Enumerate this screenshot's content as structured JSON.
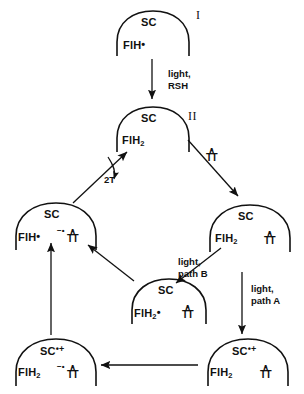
{
  "figure": {
    "type": "reaction-scheme"
  },
  "nodes": [
    {
      "id": "top",
      "roman": "I",
      "sc": "SC",
      "sc_charge": "",
      "flavin": "FlH",
      "flavin_sub": "",
      "flavin_dot": "•",
      "dimer": null
    },
    {
      "id": "second",
      "roman": "II",
      "sc": "SC",
      "sc_charge": "",
      "flavin": "FlH",
      "flavin_sub": "2",
      "flavin_dot": "",
      "dimer": null
    },
    {
      "id": "right",
      "roman": "",
      "sc": "SC",
      "sc_charge": "",
      "flavin": "FlH",
      "flavin_sub": "2",
      "flavin_dot": "",
      "dimer": {
        "caret": "∧",
        "tt": "TT",
        "charge": ""
      }
    },
    {
      "id": "center",
      "roman": "",
      "sc": "SC",
      "sc_charge": "",
      "flavin": "FlH",
      "flavin_sub": "2",
      "flavin_dot": "•",
      "dimer": {
        "caret": "∧",
        "tt": "TT",
        "charge": ""
      }
    },
    {
      "id": "left",
      "roman": "",
      "sc": "SC",
      "sc_charge": "",
      "flavin": "FlH",
      "flavin_sub": "",
      "flavin_dot": "•",
      "dimer": {
        "caret": "∧",
        "tt": "TT",
        "charge": "−•"
      }
    },
    {
      "id": "bottom-left",
      "roman": "",
      "sc": "SC",
      "sc_charge": "•+",
      "flavin": "FlH",
      "flavin_sub": "2",
      "flavin_dot": "",
      "dimer": {
        "caret": "∧",
        "tt": "TT",
        "charge": "−•"
      }
    },
    {
      "id": "bottom-right",
      "roman": "",
      "sc": "SC",
      "sc_charge": "•+",
      "flavin": "FlH",
      "flavin_sub": "2",
      "flavin_dot": "",
      "dimer": {
        "caret": "∧",
        "tt": "TT",
        "charge": ""
      }
    }
  ],
  "labels": {
    "light_rsh_line1": "light,",
    "light_rsh_line2": "RSH",
    "path_b_line1": "light,",
    "path_b_line2": "path B",
    "path_a_line1": "light,",
    "path_a_line2": "path A",
    "two_t": "2T",
    "dimer_caret": "∧",
    "dimer_tt": "TT"
  },
  "colors": {
    "stroke": "#111111",
    "background": "#ffffff"
  }
}
